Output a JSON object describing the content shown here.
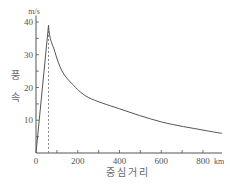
{
  "chart_data": {
    "type": "line",
    "title": "",
    "xlabel": "중심거리",
    "ylabel": "풍속",
    "x_unit": "km",
    "y_unit": "m/s",
    "xlim": [
      0,
      900
    ],
    "ylim": [
      0,
      42
    ],
    "x_ticks": [
      0,
      100,
      200,
      300,
      400,
      500,
      600,
      700,
      800
    ],
    "x_tick_labels": [
      "0",
      "200",
      "400",
      "600",
      "800"
    ],
    "y_ticks": [
      0,
      5,
      10,
      15,
      20,
      25,
      30,
      35,
      40
    ],
    "y_tick_labels": [
      "10",
      "20",
      "30",
      "40"
    ],
    "grid": false,
    "legend": null,
    "series": [
      {
        "name": "풍속",
        "x": [
          0,
          60,
          90,
          125,
          175,
          250,
          400,
          600,
          800,
          890
        ],
        "y": [
          0,
          39,
          31,
          25,
          21,
          17,
          13.5,
          9.5,
          7,
          6
        ]
      }
    ],
    "annotations": [
      {
        "type": "vertical-dashed-line",
        "x": 60,
        "label": "최대풍속반경"
      }
    ]
  }
}
